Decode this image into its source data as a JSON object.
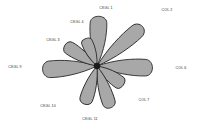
{
  "figure": {
    "type": "petal-diagram",
    "background_color": "#ffffff",
    "center": {
      "x": 97,
      "y": 66
    },
    "center_marker_color": "#1a1a1a"
  },
  "style": {
    "petal_fill": "#a8a8a8",
    "petal_stroke": "#2e2e2e",
    "label_color": "#2b2b2b"
  },
  "chart_data": {
    "type": "pie",
    "title": "",
    "xlabel": "",
    "ylabel": "",
    "legend_position": "none",
    "grid": false,
    "categories": [
      "CKGL 1",
      "COL 2",
      "COL 6",
      "COL 7",
      "CKGL 11",
      "CKGL 10",
      "CKGL 9",
      "CKGL 3",
      "CKGL 4"
    ],
    "values": [
      52,
      63,
      58,
      34,
      46,
      42,
      57,
      40,
      31
    ],
    "petals": [
      {
        "label": "CKGL 1",
        "angle_deg": -88,
        "length": 52,
        "half_width": 9,
        "label_x": 106,
        "label_y": 9
      },
      {
        "label": "COL 2",
        "angle_deg": -41,
        "length": 63,
        "half_width": 8,
        "label_x": 167,
        "label_y": 11
      },
      {
        "label": "COL 6",
        "angle_deg": 2,
        "length": 58,
        "half_width": 9,
        "label_x": 181,
        "label_y": 69
      },
      {
        "label": "COL 7",
        "angle_deg": 36,
        "length": 34,
        "half_width": 7,
        "label_x": 144,
        "label_y": 101
      },
      {
        "label": "CKGL 11",
        "angle_deg": 72,
        "length": 46,
        "half_width": 7,
        "label_x": 90,
        "label_y": 120
      },
      {
        "label": "CKGL 10",
        "angle_deg": 108,
        "length": 42,
        "half_width": 7,
        "label_x": 48,
        "label_y": 107
      },
      {
        "label": "CKGL 9",
        "angle_deg": 176,
        "length": 57,
        "half_width": 9,
        "label_x": 15,
        "label_y": 68
      },
      {
        "label": "CKGL 3",
        "angle_deg": -147,
        "length": 40,
        "half_width": 7,
        "label_x": 53,
        "label_y": 41
      },
      {
        "label": "CKGL 4",
        "angle_deg": -113,
        "length": 31,
        "half_width": 6,
        "label_x": 77,
        "label_y": 23
      }
    ]
  }
}
